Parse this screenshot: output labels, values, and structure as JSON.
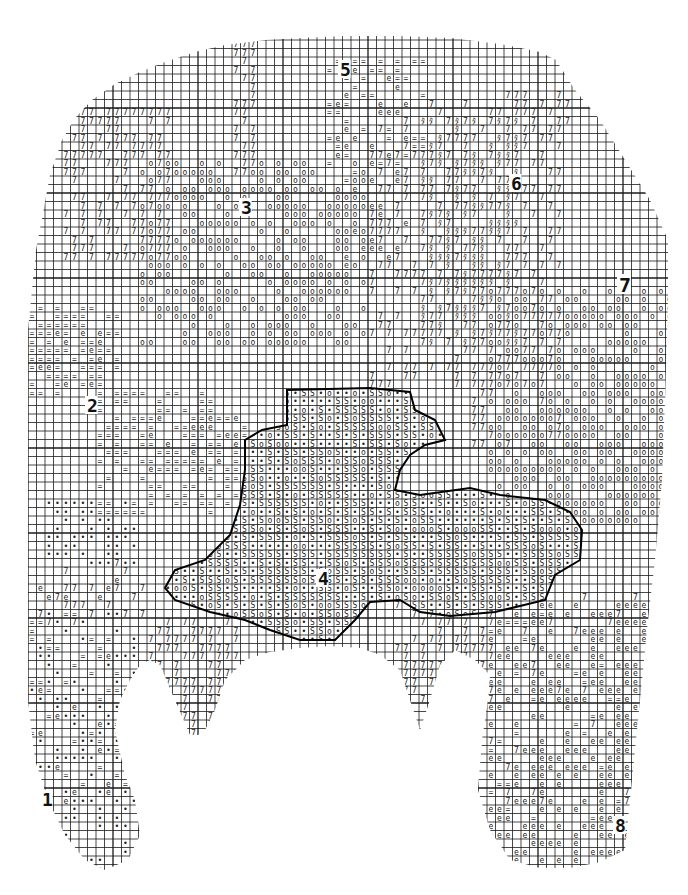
{
  "chart": {
    "kind": "hand-drawn stitch chart (needlework / knitting grid pattern)",
    "grid": {
      "cell_px": 8.5,
      "origin_x": 28,
      "origin_y": 40,
      "cols": 77,
      "rows": 101,
      "line_color": "#1a1a1a",
      "background": "#ffffff"
    },
    "symbols": [
      {
        "key": "7",
        "glyph": "7",
        "name": "seven-symbol"
      },
      {
        "key": "o",
        "glyph": "o",
        "name": "circle-symbol"
      },
      {
        "key": "=",
        "glyph": "=",
        "name": "equals-symbol"
      },
      {
        "key": "e",
        "glyph": "e",
        "name": "loop-e-symbol"
      },
      {
        "key": "•",
        "glyph": "•",
        "name": "dot-symbol"
      },
      {
        "key": "S",
        "glyph": "S",
        "name": "s-symbol"
      },
      {
        "key": "#",
        "glyph": "ﾀ",
        "name": "hatched-symbol"
      }
    ],
    "section_labels": [
      {
        "text": "1",
        "x": 42,
        "y": 806,
        "size": 18
      },
      {
        "text": "2",
        "x": 87,
        "y": 412,
        "size": 18
      },
      {
        "text": "3",
        "x": 241,
        "y": 214,
        "size": 18
      },
      {
        "text": "4",
        "x": 318,
        "y": 585,
        "size": 18
      },
      {
        "text": "5",
        "x": 340,
        "y": 76,
        "size": 18
      },
      {
        "text": "6",
        "x": 511,
        "y": 190,
        "size": 18
      },
      {
        "text": "7",
        "x": 619,
        "y": 292,
        "size": 20
      },
      {
        "text": "8",
        "x": 615,
        "y": 832,
        "size": 18
      }
    ],
    "outline_polygon": [
      [
        28,
        425
      ],
      [
        28,
        330
      ],
      [
        36,
        250
      ],
      [
        50,
        175
      ],
      [
        62,
        140
      ],
      [
        75,
        118
      ],
      [
        92,
        100
      ],
      [
        115,
        84
      ],
      [
        140,
        72
      ],
      [
        165,
        62
      ],
      [
        195,
        52
      ],
      [
        225,
        45
      ],
      [
        265,
        40
      ],
      [
        300,
        38
      ],
      [
        345,
        36
      ],
      [
        400,
        36
      ],
      [
        450,
        38
      ],
      [
        500,
        44
      ],
      [
        540,
        52
      ],
      [
        556,
        60
      ],
      [
        575,
        90
      ],
      [
        600,
        120
      ],
      [
        625,
        160
      ],
      [
        650,
        200
      ],
      [
        668,
        240
      ],
      [
        668,
        300
      ],
      [
        665,
        400
      ],
      [
        662,
        480
      ],
      [
        655,
        560
      ],
      [
        648,
        620
      ],
      [
        640,
        700
      ],
      [
        632,
        780
      ],
      [
        625,
        850
      ],
      [
        600,
        862
      ],
      [
        570,
        868
      ],
      [
        540,
        868
      ],
      [
        510,
        860
      ],
      [
        490,
        830
      ],
      [
        478,
        790
      ],
      [
        482,
        740
      ],
      [
        488,
        700
      ],
      [
        490,
        675
      ],
      [
        475,
        660
      ],
      [
        455,
        650
      ],
      [
        440,
        665
      ],
      [
        430,
        700
      ],
      [
        420,
        730
      ],
      [
        400,
        670
      ],
      [
        380,
        655
      ],
      [
        360,
        648
      ],
      [
        330,
        646
      ],
      [
        300,
        648
      ],
      [
        270,
        652
      ],
      [
        245,
        660
      ],
      [
        225,
        680
      ],
      [
        215,
        710
      ],
      [
        205,
        730
      ],
      [
        198,
        735
      ],
      [
        190,
        735
      ],
      [
        175,
        700
      ],
      [
        160,
        665
      ],
      [
        150,
        660
      ],
      [
        140,
        665
      ],
      [
        130,
        680
      ],
      [
        120,
        700
      ],
      [
        115,
        730
      ],
      [
        125,
        775
      ],
      [
        135,
        800
      ],
      [
        140,
        835
      ],
      [
        128,
        860
      ],
      [
        105,
        870
      ],
      [
        85,
        860
      ],
      [
        65,
        835
      ],
      [
        48,
        800
      ],
      [
        35,
        760
      ],
      [
        28,
        700
      ],
      [
        28,
        600
      ]
    ],
    "s_region_outline": [
      [
        287,
        390
      ],
      [
        370,
        388
      ],
      [
        410,
        392
      ],
      [
        415,
        410
      ],
      [
        435,
        420
      ],
      [
        445,
        440
      ],
      [
        425,
        445
      ],
      [
        410,
        455
      ],
      [
        400,
        470
      ],
      [
        395,
        490
      ],
      [
        420,
        495
      ],
      [
        470,
        488
      ],
      [
        500,
        495
      ],
      [
        545,
        500
      ],
      [
        570,
        512
      ],
      [
        582,
        530
      ],
      [
        580,
        560
      ],
      [
        555,
        575
      ],
      [
        545,
        600
      ],
      [
        495,
        612
      ],
      [
        450,
        616
      ],
      [
        420,
        612
      ],
      [
        400,
        600
      ],
      [
        370,
        602
      ],
      [
        355,
        620
      ],
      [
        335,
        640
      ],
      [
        300,
        640
      ],
      [
        270,
        630
      ],
      [
        245,
        620
      ],
      [
        210,
        612
      ],
      [
        175,
        600
      ],
      [
        165,
        588
      ],
      [
        175,
        570
      ],
      [
        205,
        560
      ],
      [
        230,
        535
      ],
      [
        240,
        505
      ],
      [
        245,
        470
      ],
      [
        245,
        440
      ],
      [
        262,
        430
      ],
      [
        287,
        425
      ]
    ],
    "regions": [
      {
        "symbol": "7",
        "name": "left-upper-sevens",
        "x0": 70,
        "y0": 110,
        "x1": 165,
        "y1": 260,
        "density": 0.55
      },
      {
        "symbol": "7",
        "name": "center-vertical-sevens",
        "x0": 232,
        "y0": 45,
        "x1": 250,
        "y1": 175,
        "density": 0.7
      },
      {
        "symbol": "o",
        "name": "upper-center-circles",
        "x0": 140,
        "y0": 160,
        "x1": 360,
        "y1": 340,
        "density": 0.45
      },
      {
        "symbol": "=",
        "name": "top-center-equals",
        "x0": 330,
        "y0": 60,
        "x1": 420,
        "y1": 180,
        "density": 0.25
      },
      {
        "symbol": "e",
        "name": "top-center-loops",
        "x0": 340,
        "y0": 70,
        "x1": 410,
        "y1": 270,
        "density": 0.18
      },
      {
        "symbol": "7",
        "name": "right-center-sevens",
        "x0": 370,
        "y0": 100,
        "x1": 560,
        "y1": 380,
        "density": 0.35
      },
      {
        "symbol": "#",
        "name": "hatched-diagonal",
        "x0": 420,
        "y0": 120,
        "x1": 520,
        "y1": 345,
        "density": 0.45
      },
      {
        "symbol": "7",
        "name": "top-right-sevens",
        "x0": 500,
        "y0": 95,
        "x1": 570,
        "y1": 135,
        "density": 0.4
      },
      {
        "symbol": "o",
        "name": "right-circles",
        "x0": 495,
        "y0": 290,
        "x1": 668,
        "y1": 520,
        "density": 0.55
      },
      {
        "symbol": "7",
        "name": "right-mid-sevens",
        "x0": 470,
        "y0": 280,
        "x1": 560,
        "y1": 440,
        "density": 0.4
      },
      {
        "symbol": "=",
        "name": "left-equals-cluster",
        "x0": 30,
        "y0": 310,
        "x1": 120,
        "y1": 390,
        "density": 0.5
      },
      {
        "symbol": "e",
        "name": "left-loops-cluster",
        "x0": 40,
        "y0": 330,
        "x1": 110,
        "y1": 385,
        "density": 0.4
      },
      {
        "symbol": "=",
        "name": "mid-left-equals",
        "x0": 100,
        "y0": 390,
        "x1": 245,
        "y1": 510,
        "density": 0.4
      },
      {
        "symbol": "e",
        "name": "mid-left-loops",
        "x0": 140,
        "y0": 420,
        "x1": 240,
        "y1": 470,
        "density": 0.4
      },
      {
        "symbol": "•",
        "name": "left-dots-cluster",
        "x0": 50,
        "y0": 505,
        "x1": 130,
        "y1": 560,
        "density": 0.6
      },
      {
        "symbol": "7",
        "name": "left-lower-sevens",
        "x0": 40,
        "y0": 560,
        "x1": 140,
        "y1": 620,
        "density": 0.2
      },
      {
        "symbol": "e",
        "name": "left-lower-loops",
        "x0": 30,
        "y0": 580,
        "x1": 140,
        "y1": 600,
        "density": 0.25
      },
      {
        "symbol": "•",
        "name": "left-leg-dots",
        "x0": 30,
        "y0": 610,
        "x1": 140,
        "y1": 870,
        "density": 0.25
      },
      {
        "symbol": "=",
        "name": "left-leg-equals",
        "x0": 30,
        "y0": 610,
        "x1": 130,
        "y1": 790,
        "density": 0.15
      },
      {
        "symbol": "e",
        "name": "left-leg-loops",
        "x0": 40,
        "y0": 660,
        "x1": 110,
        "y1": 860,
        "density": 0.12
      },
      {
        "symbol": "7",
        "name": "center-bottom-sevens",
        "x0": 150,
        "y0": 620,
        "x1": 240,
        "y1": 735,
        "density": 0.6
      },
      {
        "symbol": "7",
        "name": "mid-bottom-sevens",
        "x0": 400,
        "y0": 600,
        "x1": 490,
        "y1": 700,
        "density": 0.4
      },
      {
        "symbol": "e",
        "name": "right-leg-loops",
        "x0": 490,
        "y0": 600,
        "x1": 640,
        "y1": 860,
        "density": 0.35
      },
      {
        "symbol": "=",
        "name": "right-leg-equals",
        "x0": 490,
        "y0": 610,
        "x1": 620,
        "y1": 820,
        "density": 0.1
      },
      {
        "symbol": "7",
        "name": "right-leg-sevens",
        "x0": 490,
        "y0": 600,
        "x1": 640,
        "y1": 800,
        "density": 0.1
      }
    ],
    "s_fill": {
      "symbols": [
        "S",
        "•",
        "o"
      ],
      "weights": [
        0.5,
        0.35,
        0.15
      ]
    }
  }
}
